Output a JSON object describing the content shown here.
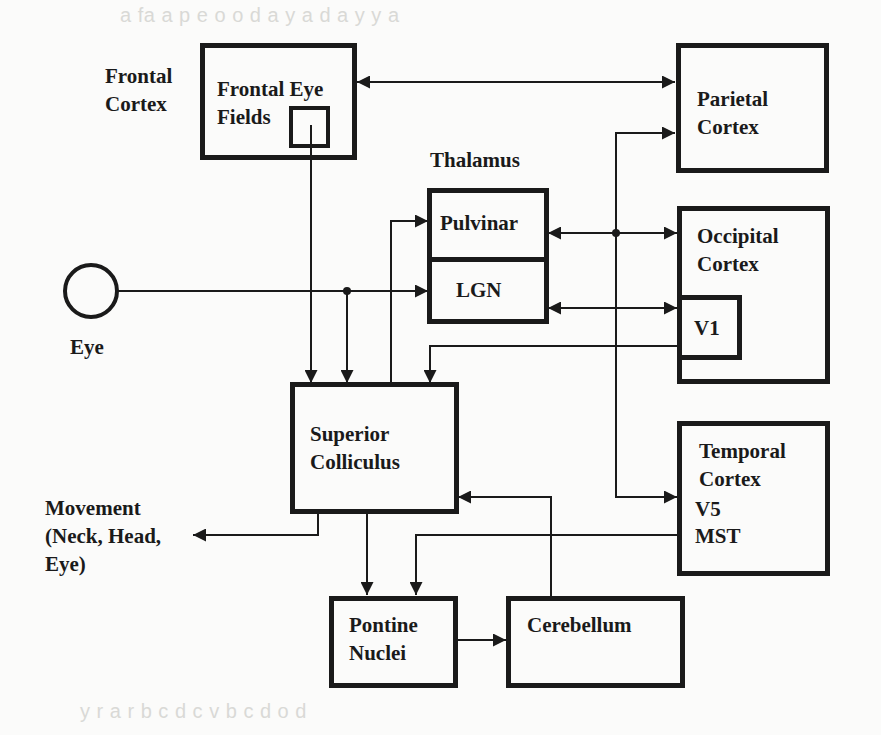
{
  "diagram": {
    "colors": {
      "ink": "#1a1a1a",
      "background": "#fbfbfa",
      "bleed_text": "#d9d9d6"
    },
    "nodes": {
      "frontal_cortex": {
        "label": "Frontal\nCortex"
      },
      "frontal_eye_fields": {
        "label": "Frontal Eye\nFields"
      },
      "parietal_cortex": {
        "label": "Parietal\nCortex"
      },
      "thalamus": {
        "label": "Thalamus"
      },
      "pulvinar": {
        "label": "Pulvinar"
      },
      "lgn": {
        "label": "LGN"
      },
      "occipital_cortex": {
        "label": "Occipital\nCortex"
      },
      "v1": {
        "label": "V1"
      },
      "eye": {
        "label": "Eye"
      },
      "superior_colliculus": {
        "label": "Superior\nColliculus"
      },
      "temporal_cortex": {
        "label": "Temporal\nCortex"
      },
      "v5": {
        "label": "V5"
      },
      "mst": {
        "label": "MST"
      },
      "movement": {
        "label": "Movement\n(Neck, Head,\nEye)"
      },
      "pontine_nuclei": {
        "label": "Pontine\nNuclei"
      },
      "cerebellum": {
        "label": "Cerebellum"
      }
    },
    "edges": [
      {
        "from": "Frontal Eye Fields",
        "to": "Parietal Cortex",
        "type": "bidirectional"
      },
      {
        "from": "Frontal Eye Fields",
        "to": "Superior Colliculus",
        "type": "directed"
      },
      {
        "from": "Eye",
        "to": "LGN",
        "type": "directed"
      },
      {
        "from": "Eye",
        "to": "Superior Colliculus",
        "type": "directed"
      },
      {
        "from": "Superior Colliculus",
        "to": "Pulvinar",
        "type": "directed"
      },
      {
        "from": "Pulvinar",
        "to": "Occipital Cortex",
        "type": "bidirectional"
      },
      {
        "from": "Pulvinar",
        "to": "Parietal Cortex",
        "type": "directed"
      },
      {
        "from": "Pulvinar",
        "to": "Temporal Cortex",
        "type": "directed"
      },
      {
        "from": "LGN",
        "to": "V1",
        "type": "bidirectional"
      },
      {
        "from": "V1",
        "to": "Superior Colliculus",
        "type": "directed"
      },
      {
        "from": "Superior Colliculus",
        "to": "Movement",
        "type": "directed"
      },
      {
        "from": "Superior Colliculus",
        "to": "Pontine Nuclei",
        "type": "directed"
      },
      {
        "from": "V5/MST",
        "to": "Pontine Nuclei",
        "type": "directed"
      },
      {
        "from": "Pontine Nuclei",
        "to": "Cerebellum",
        "type": "directed"
      },
      {
        "from": "Cerebellum",
        "to": "Superior Colliculus",
        "type": "directed"
      }
    ]
  }
}
